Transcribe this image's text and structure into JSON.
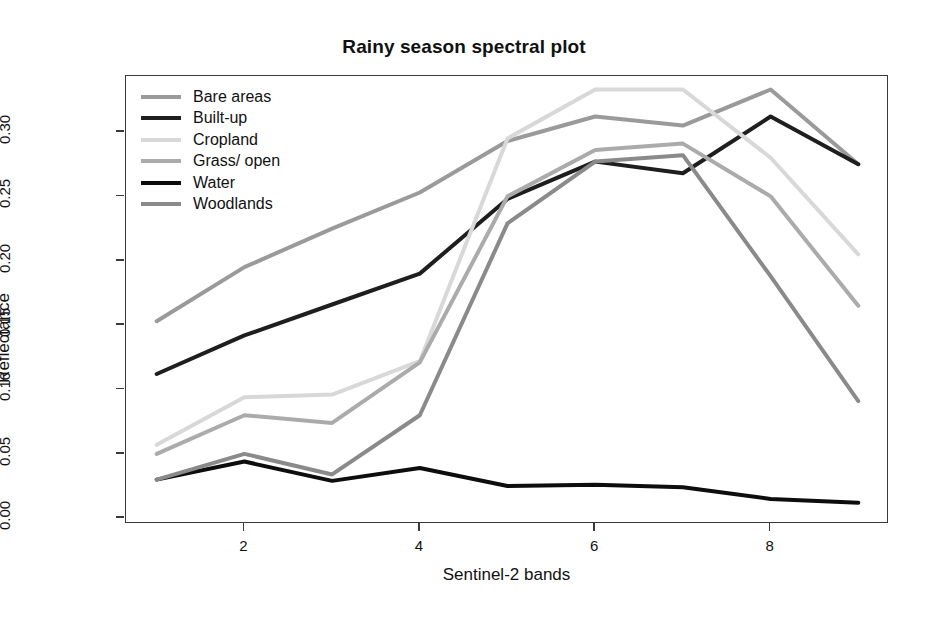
{
  "chart_data": {
    "type": "line",
    "title": "Rainy season spectral plot",
    "xlabel": "Sentinel-2 bands",
    "ylabel": "Reflectance",
    "x": [
      1,
      2,
      3,
      4,
      5,
      6,
      7,
      8,
      9
    ],
    "xtick_labels": [
      "2",
      "4",
      "6",
      "8"
    ],
    "xtick_values": [
      2,
      4,
      6,
      8
    ],
    "ytick_labels": [
      "0.00",
      "0.05",
      "0.10",
      "0.15",
      "0.20",
      "0.25",
      "0.30"
    ],
    "ytick_values": [
      0.0,
      0.05,
      0.1,
      0.15,
      0.2,
      0.25,
      0.3
    ],
    "xlim": [
      0.65,
      9.35
    ],
    "ylim": [
      -0.0045,
      0.3435
    ],
    "grid": false,
    "legend_position": "top-left inside",
    "series": [
      {
        "name": "Bare areas",
        "color": "#9a9a9a",
        "values": [
          0.153,
          0.195,
          0.225,
          0.253,
          0.293,
          0.312,
          0.305,
          0.333,
          0.275
        ]
      },
      {
        "name": "Built-up",
        "color": "#1e1e1e",
        "values": [
          0.112,
          0.142,
          0.166,
          0.19,
          0.248,
          0.277,
          0.268,
          0.312,
          0.275
        ]
      },
      {
        "name": "Cropland",
        "color": "#d8d8d8",
        "values": [
          0.057,
          0.094,
          0.096,
          0.122,
          0.295,
          0.333,
          0.333,
          0.28,
          0.205
        ]
      },
      {
        "name": "Grass/ open",
        "color": "#ababab",
        "values": [
          0.05,
          0.08,
          0.074,
          0.121,
          0.25,
          0.286,
          0.291,
          0.25,
          0.165
        ]
      },
      {
        "name": "Water",
        "color": "#0d0d0d",
        "values": [
          0.03,
          0.044,
          0.029,
          0.039,
          0.025,
          0.026,
          0.024,
          0.015,
          0.012
        ]
      },
      {
        "name": "Woodlands",
        "color": "#8a8a8a",
        "values": [
          0.03,
          0.05,
          0.034,
          0.08,
          0.229,
          0.277,
          0.282,
          0.188,
          0.091
        ]
      }
    ]
  },
  "legend": {
    "items": [
      {
        "label": "Bare areas",
        "color": "#9a9a9a"
      },
      {
        "label": "Built-up",
        "color": "#1e1e1e"
      },
      {
        "label": "Cropland",
        "color": "#d8d8d8"
      },
      {
        "label": "Grass/ open",
        "color": "#ababab"
      },
      {
        "label": "Water",
        "color": "#0d0d0d"
      },
      {
        "label": "Woodlands",
        "color": "#8a8a8a"
      }
    ]
  },
  "axes": {
    "frame_color": "#3a3a3a"
  }
}
